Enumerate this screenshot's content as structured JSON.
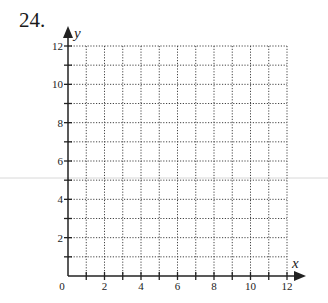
{
  "problem": {
    "number": "24."
  },
  "graph": {
    "x_axis": {
      "label": "x",
      "min": 0,
      "max": 12,
      "tick_labels": [
        "0",
        "2",
        "4",
        "6",
        "8",
        "10",
        "12"
      ]
    },
    "y_axis": {
      "label": "y",
      "min": 0,
      "max": 12,
      "tick_labels": [
        "2",
        "4",
        "6",
        "8",
        "10",
        "12"
      ]
    },
    "grid": {
      "style": "dotted",
      "step": 1
    }
  },
  "chart_data": {
    "type": "scatter",
    "title": "",
    "xlabel": "x",
    "ylabel": "y",
    "xlim": [
      0,
      12
    ],
    "ylim": [
      0,
      12
    ],
    "x_ticks": [
      0,
      2,
      4,
      6,
      8,
      10,
      12
    ],
    "y_ticks": [
      2,
      4,
      6,
      8,
      10,
      12
    ],
    "grid": true,
    "series": []
  }
}
